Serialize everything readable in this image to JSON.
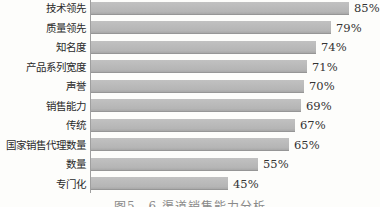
{
  "chart_data": {
    "type": "bar",
    "orientation": "horizontal",
    "title": "",
    "xlabel": "",
    "ylabel": "",
    "categories": [
      "技术领先",
      "质量领先",
      "知名度",
      "产品系列宽度",
      "声誉",
      "销售能力",
      "传统",
      "国家销售代理数量",
      "数量",
      "专门化"
    ],
    "values": [
      85,
      79,
      74,
      71,
      70,
      69,
      67,
      65,
      55,
      45
    ],
    "value_labels": [
      "85%",
      "79%",
      "74%",
      "71%",
      "70%",
      "69%",
      "67%",
      "65%",
      "55%",
      "45%"
    ],
    "xlim": [
      0,
      100
    ],
    "grid": false,
    "legend": false,
    "caption": "图5—6 渠道销售能力分析",
    "layout": {
      "px_per_percent": 3.04,
      "row_pitch_px": 19.5,
      "first_row_top_px": 1
    },
    "colors": {
      "bar": "#b5b5b5",
      "bar_edge": "#969696",
      "axis": "#9f9f9f",
      "label_text": "#2a2a2a",
      "value_text": "#333333",
      "background": "#fdfdfb",
      "caption_text": "#8a8a8a"
    }
  }
}
